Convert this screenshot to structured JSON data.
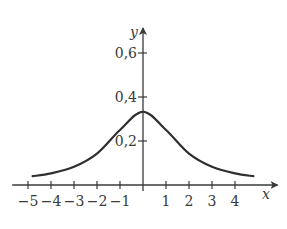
{
  "chart_data": {
    "type": "line",
    "title": "",
    "xlabel": "x",
    "ylabel": "y",
    "xlim": [
      -5.6,
      5.5
    ],
    "ylim": [
      0,
      0.7
    ],
    "grid": false,
    "legend": null,
    "x_ticks": [
      -5,
      -4,
      -3,
      -2,
      -1,
      1,
      2,
      3,
      4
    ],
    "x_tick_labels": [
      "−5",
      "−4",
      "−3",
      "−2",
      "−1",
      "1",
      "2",
      "3",
      "4"
    ],
    "y_ticks": [
      0.2,
      0.4,
      0.6
    ],
    "y_tick_labels": [
      "0,2",
      "0,4",
      "0,6"
    ],
    "series": [
      {
        "name": "f(x)",
        "x": [
          -4.8,
          -4,
          -3,
          -2,
          -1,
          0,
          1,
          2,
          3,
          4,
          4.8
        ],
        "y": [
          0.04,
          0.053,
          0.083,
          0.143,
          0.25,
          0.333,
          0.25,
          0.143,
          0.083,
          0.053,
          0.04
        ]
      }
    ]
  }
}
